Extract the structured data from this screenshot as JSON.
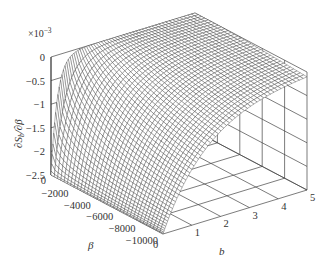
{
  "chart_data": {
    "type": "surface",
    "title": "",
    "zlabel": "∂Sₗ/∂β",
    "zlabel_parts": {
      "main": "∂S",
      "sub": "b",
      "tail": "/∂β"
    },
    "z_multiplier": "×10",
    "z_multiplier_exp": "−3",
    "xlabel": "b",
    "ylabel": "β",
    "xlim": [
      0,
      5
    ],
    "ylim": [
      -10000,
      0
    ],
    "zlim": [
      -2.5,
      0
    ],
    "x_ticks": [
      "0",
      "1",
      "2",
      "3",
      "4",
      "5"
    ],
    "x_tick_values": [
      0,
      1,
      2,
      3,
      4,
      5
    ],
    "y_ticks": [
      "0",
      "−2000",
      "−4000",
      "−6000",
      "−8000",
      "−10000"
    ],
    "y_tick_values": [
      0,
      -2000,
      -4000,
      -6000,
      -8000,
      -10000
    ],
    "z_ticks": [
      "0",
      "−0.5",
      "−1",
      "−1.5",
      "−2",
      "−2.5"
    ],
    "z_tick_values": [
      0,
      -0.5,
      -1,
      -1.5,
      -2,
      -2.5
    ],
    "grid": true,
    "legend": "none",
    "surface_samples": {
      "description": "Approximate values (×10^-3) read from the mesh; surface tends to -2.5 as b→0 and approaches 0 as b grows; decay is fastest at β=0 and slower toward β=-10000.",
      "b": [
        0,
        0.5,
        1,
        2,
        3,
        4,
        5
      ],
      "beta": [
        0,
        -2000,
        -4000,
        -6000,
        -8000,
        -10000
      ],
      "z": [
        [
          -2.5,
          -0.34,
          -0.05,
          -0.01,
          0.0,
          0.0,
          0.0
        ],
        [
          -2.5,
          -0.75,
          -0.25,
          -0.06,
          -0.02,
          -0.01,
          -0.01
        ],
        [
          -2.5,
          -1.0,
          -0.45,
          -0.14,
          -0.06,
          -0.03,
          -0.02
        ],
        [
          -2.5,
          -1.15,
          -0.6,
          -0.22,
          -0.1,
          -0.05,
          -0.03
        ],
        [
          -2.5,
          -1.25,
          -0.7,
          -0.3,
          -0.14,
          -0.08,
          -0.05
        ],
        [
          -2.5,
          -1.3,
          -0.78,
          -0.35,
          -0.18,
          -0.1,
          -0.06
        ]
      ]
    }
  }
}
